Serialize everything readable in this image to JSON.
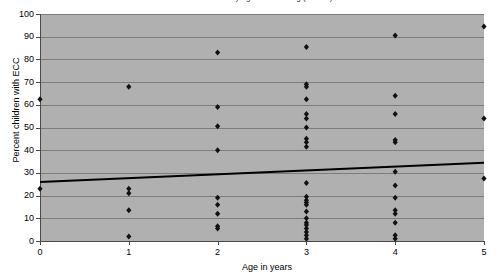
{
  "figure": {
    "title_clipped": "Percent with ECC by age at screening (scatter)",
    "background_color": "#ffffff",
    "plot_area_color": "#b0b0b0",
    "gridline_color": "#7d7d7d",
    "axis_color": "#4a4a4a",
    "marker_color": "#111111",
    "trendline_color": "#000000"
  },
  "chart_data": {
    "type": "scatter",
    "title": "",
    "xlabel": "Age in years",
    "ylabel": "Percent children with ECC",
    "xlim": [
      0,
      5
    ],
    "ylim": [
      0,
      100
    ],
    "xticks": [
      "0",
      "1",
      "2",
      "3",
      "4",
      "5"
    ],
    "yticks": [
      "0",
      "10",
      "20",
      "30",
      "40",
      "50",
      "60",
      "70",
      "80",
      "90",
      "100"
    ],
    "grid": "horizontal",
    "legend": "none",
    "marker_shape": "diamond",
    "points": [
      {
        "x": 0,
        "y": 62.5
      },
      {
        "x": 0,
        "y": 23.0
      },
      {
        "x": 1,
        "y": 68.0
      },
      {
        "x": 1,
        "y": 23.0
      },
      {
        "x": 1,
        "y": 21.0
      },
      {
        "x": 1,
        "y": 13.5
      },
      {
        "x": 1,
        "y": 2.0
      },
      {
        "x": 2,
        "y": 83.0
      },
      {
        "x": 2,
        "y": 59.0
      },
      {
        "x": 2,
        "y": 50.5
      },
      {
        "x": 2,
        "y": 40.0
      },
      {
        "x": 2,
        "y": 19.0
      },
      {
        "x": 2,
        "y": 16.0
      },
      {
        "x": 2,
        "y": 12.0
      },
      {
        "x": 2,
        "y": 6.5
      },
      {
        "x": 2,
        "y": 5.5
      },
      {
        "x": 3,
        "y": 85.5
      },
      {
        "x": 3,
        "y": 69.0
      },
      {
        "x": 3,
        "y": 68.0
      },
      {
        "x": 3,
        "y": 62.5
      },
      {
        "x": 3,
        "y": 56.0
      },
      {
        "x": 3,
        "y": 54.0
      },
      {
        "x": 3,
        "y": 50.0
      },
      {
        "x": 3,
        "y": 45.0
      },
      {
        "x": 3,
        "y": 43.5
      },
      {
        "x": 3,
        "y": 41.5
      },
      {
        "x": 3,
        "y": 25.5
      },
      {
        "x": 3,
        "y": 19.5
      },
      {
        "x": 3,
        "y": 18.0
      },
      {
        "x": 3,
        "y": 17.0
      },
      {
        "x": 3,
        "y": 16.0
      },
      {
        "x": 3,
        "y": 13.0
      },
      {
        "x": 3,
        "y": 10.0
      },
      {
        "x": 3,
        "y": 8.0
      },
      {
        "x": 3,
        "y": 7.0
      },
      {
        "x": 3,
        "y": 5.5
      },
      {
        "x": 3,
        "y": 4.0
      },
      {
        "x": 3,
        "y": 2.5
      },
      {
        "x": 3,
        "y": 1.0
      },
      {
        "x": 4,
        "y": 90.5
      },
      {
        "x": 4,
        "y": 64.0
      },
      {
        "x": 4,
        "y": 56.0
      },
      {
        "x": 4,
        "y": 44.5
      },
      {
        "x": 4,
        "y": 43.5
      },
      {
        "x": 4,
        "y": 30.5
      },
      {
        "x": 4,
        "y": 24.5
      },
      {
        "x": 4,
        "y": 19.0
      },
      {
        "x": 4,
        "y": 13.5
      },
      {
        "x": 4,
        "y": 12.0
      },
      {
        "x": 4,
        "y": 8.0
      },
      {
        "x": 4,
        "y": 2.5
      },
      {
        "x": 4,
        "y": 1.0
      },
      {
        "x": 5,
        "y": 94.5
      },
      {
        "x": 5,
        "y": 54.0
      },
      {
        "x": 5,
        "y": 27.5
      }
    ],
    "trendline": {
      "x": [
        0,
        5
      ],
      "y": [
        26.0,
        34.5
      ],
      "style": "solid",
      "width_px": 2
    }
  }
}
